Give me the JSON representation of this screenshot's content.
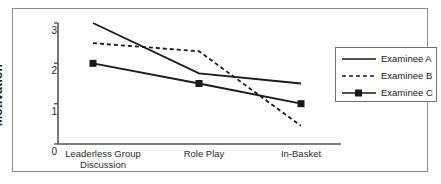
{
  "chart_data": {
    "type": "line",
    "title": "",
    "xlabel": "",
    "ylabel": "Motivation",
    "categories": [
      "Leaderless Group Discussion",
      "Role Play",
      "In-Basket"
    ],
    "category_lines": [
      [
        "Leaderless Group",
        "Discussion"
      ],
      [
        "Role Play"
      ],
      [
        "In-Basket"
      ]
    ],
    "ylim": [
      0,
      3
    ],
    "yticks": [
      0,
      1,
      2,
      3
    ],
    "ytick_labels": [
      "0",
      "1",
      "2",
      "3"
    ],
    "grid": false,
    "legend_position": "right",
    "series": [
      {
        "name": "Examinee A",
        "values": [
          3.0,
          1.75,
          1.5
        ],
        "style": "solid",
        "marker": "none",
        "color": "#1a1a1a"
      },
      {
        "name": "Examinee B",
        "values": [
          2.5,
          2.3,
          0.45
        ],
        "style": "dashed",
        "marker": "none",
        "color": "#1a1a1a"
      },
      {
        "name": "Examinee C",
        "values": [
          2.0,
          1.5,
          1.0
        ],
        "style": "solid",
        "marker": "square",
        "color": "#1a1a1a"
      }
    ]
  },
  "axis": {
    "y_label": "Motivation",
    "y_ticks": [
      "3",
      "2",
      "1",
      "0"
    ],
    "x_categories": [
      {
        "line1": "Leaderless Group",
        "line2": "Discussion"
      },
      {
        "line1": "Role Play",
        "line2": ""
      },
      {
        "line1": "In-Basket",
        "line2": ""
      }
    ]
  },
  "legend": {
    "items": [
      {
        "label": "Examinee A",
        "style": "solid"
      },
      {
        "label": "Examinee B",
        "style": "dashed"
      },
      {
        "label": "Examinee C",
        "style": "solid-square"
      }
    ]
  },
  "colors": {
    "line": "#1a1a1a",
    "axis": "#555555",
    "frame": "#8a8a8a",
    "background": "#ffffff"
  }
}
